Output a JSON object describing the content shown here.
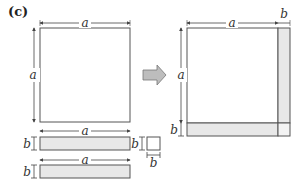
{
  "panel_label": "(c)",
  "labels": {
    "a": "a",
    "b": "b"
  },
  "colors": {
    "stroke": "#555555",
    "fill_shaded": "#e8e8e8",
    "arrow_fill": "#bdbdbd"
  },
  "left_figure": {
    "square": {
      "label_top": "a",
      "label_side": "a"
    },
    "strip1": {
      "label_top": "a",
      "label_side": "b"
    },
    "strip2": {
      "label_top": "a",
      "label_side": "b"
    },
    "small_square": {
      "label_side": "b",
      "label_bottom": "b"
    }
  },
  "right_figure": {
    "label_top_a": "a",
    "label_top_b": "b",
    "label_side_a": "a",
    "label_side_b": "b"
  }
}
